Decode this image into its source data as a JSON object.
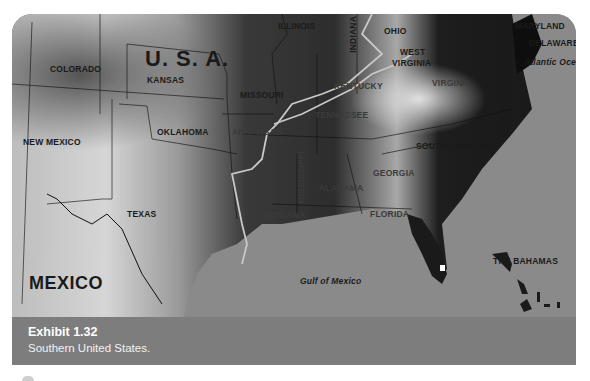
{
  "map": {
    "title_country": "U. S. A.",
    "country_south": "MEXICO",
    "states": {
      "colorado": "COLORADO",
      "kansas": "KANSAS",
      "new_mexico": "NEW MEXICO",
      "oklahoma": "OKLAHOMA",
      "texas": "TEXAS",
      "missouri": "MISSOURI",
      "arkansas": "ARKANSAS",
      "illinois": "ILLINOIS",
      "indiana": "INDIANA",
      "ohio": "OHIO",
      "west_virginia_1": "WEST",
      "west_virginia_2": "VIRGINIA",
      "kentucky": "KENTUCKY",
      "virginia": "VIRGINIA",
      "tennessee": "TENNESSEE",
      "south_carolina": "SOUTH CAROLINA",
      "georgia": "GEORGIA",
      "alabama": "ALABAMA",
      "mississippi": "MISSISSIPPI",
      "louisiana": "LOUISIANA",
      "florida": "FLORIDA",
      "maryland": "MARYLAND",
      "delaware": "DELAWARE"
    },
    "water": {
      "atlantic": "Atlantic Ocean",
      "gulf": "Gulf of Mexico"
    },
    "islands": {
      "bahamas": "THE BAHAMAS"
    },
    "colors": {
      "water": "#8a8a8a",
      "caption_bg": "#7d7d7d",
      "mississippi_river": "#c8c8c8"
    }
  },
  "caption": {
    "title": "Exhibit 1.32",
    "subtitle": "Southern United States."
  }
}
